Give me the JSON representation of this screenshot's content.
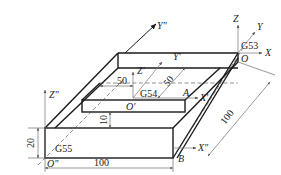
{
  "diagram": {
    "coordinate_systems": [
      {
        "name": "G53",
        "origin": "O",
        "axes": [
          "X",
          "Y",
          "Z"
        ]
      },
      {
        "name": "G54",
        "origin": "O'",
        "axes": [
          "X'",
          "Y'",
          "Z'"
        ]
      },
      {
        "name": "G55",
        "origin": "O\"",
        "axes": [
          "X\"",
          "Y\"",
          "Z\""
        ]
      }
    ],
    "labels": {
      "g53": "G53",
      "g54": "G54",
      "g55": "G55",
      "origin_machine": "O",
      "origin_g54": "O'",
      "origin_g55": "O\"",
      "x_machine": "X",
      "y_machine": "Y",
      "z_machine": "Z",
      "x_g54": "X'",
      "y_g54": "Y'",
      "z_g54": "Z'",
      "x_g55": "X\"",
      "y_g55": "Y\"",
      "z_g55": "Z\"",
      "point_a": "A",
      "point_b": "B"
    },
    "dimensions": {
      "length_bottom": "100",
      "depth_side": "100",
      "height_left": "20",
      "step_height": "10",
      "offset_x": "50",
      "offset_y": "50"
    }
  }
}
